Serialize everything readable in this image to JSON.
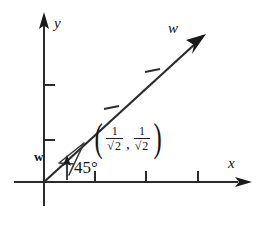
{
  "figure": {
    "background_color": "#ffffff",
    "ink_color": "#1a1a1a",
    "axes": {
      "x_label": "x",
      "y_label": "y",
      "x_tick_count": 3,
      "y_tick_count": 2
    },
    "ray": {
      "label": "w",
      "angle_degrees": 45,
      "tick_count": 2,
      "arrowhead": "solid"
    },
    "unit_vector": {
      "label": "w",
      "style": "bold",
      "arrowhead": "outline"
    },
    "angle": {
      "label": "45°",
      "value": 45,
      "unit": "degrees"
    },
    "point_label": {
      "open_paren": "(",
      "close_paren": ")",
      "comma": ",",
      "x_component": {
        "numerator": "1",
        "denominator": "2",
        "radical": "√"
      },
      "y_component": {
        "numerator": "1",
        "denominator": "2",
        "radical": "√"
      }
    }
  }
}
